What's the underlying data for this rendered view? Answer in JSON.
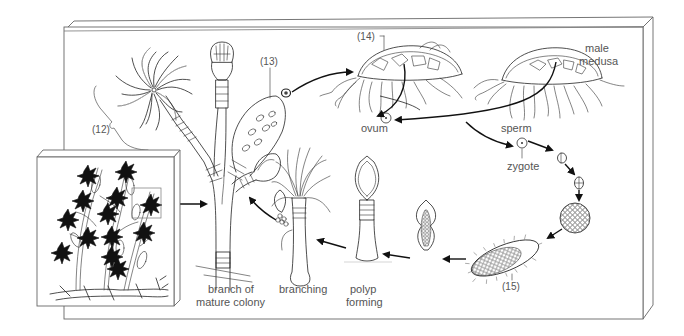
{
  "diagram": {
    "labels": {
      "label_12": "(12)",
      "label_13": "(13)",
      "label_14": "(14)",
      "label_15": "(15)",
      "male_medusa_line1": "male",
      "male_medusa_line2": "medusa",
      "ovum": "ovum",
      "sperm": "sperm",
      "zygote": "zygote",
      "branch_line1": "branch of",
      "branch_line2": "mature colony",
      "branching": "branching",
      "polyp_line1": "polyp",
      "polyp_line2": "forming"
    },
    "stages": [
      "mature colony (inset)",
      "branch of mature colony",
      "feeding polyp (12)",
      "reproductive polyp (13)",
      "female medusa (14)",
      "male medusa",
      "ovum",
      "sperm",
      "zygote",
      "2-cell stage",
      "4-cell stage",
      "blastula",
      "planula larva (15)",
      "settled planula",
      "polyp forming",
      "branching"
    ],
    "colors": {
      "ink": "#222222",
      "label_text": "#555555",
      "frame": "#666666",
      "background": "#ffffff"
    }
  }
}
